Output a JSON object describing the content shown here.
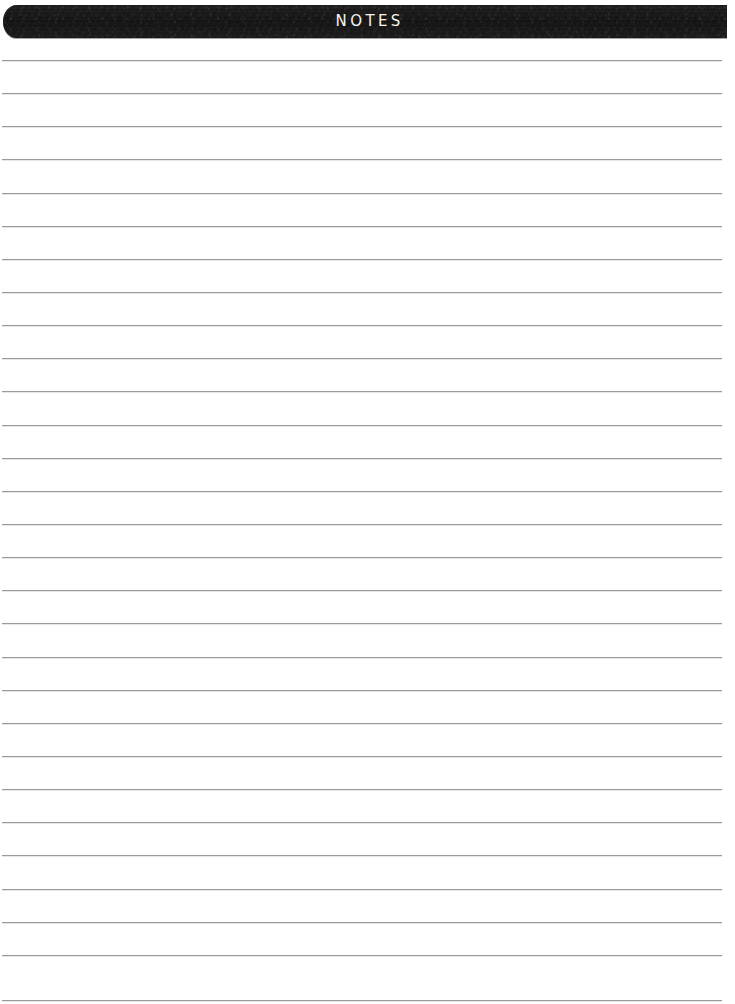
{
  "page": {
    "width": 735,
    "height": 1004,
    "background_color": "#ffffff",
    "document_type": "lined-notes-page"
  },
  "header": {
    "title": "NOTES",
    "background_color": "#1b1b1b",
    "text_color": "#f4f4f4",
    "bar_left": 3,
    "bar_top": 5,
    "bar_width": 724,
    "bar_height": 33
  },
  "ruled_lines": {
    "color": "#9a9a9a",
    "thickness": 1,
    "left": 2,
    "width": 720,
    "first_line_y": 60,
    "spacing": 33.1,
    "count": 29,
    "positions": [
      60,
      93,
      126,
      159,
      193,
      226,
      259,
      292,
      325,
      358,
      391,
      425,
      458,
      491,
      524,
      557,
      590,
      623,
      657,
      690,
      723,
      756,
      789,
      822,
      855,
      889,
      922,
      955,
      1000
    ]
  }
}
